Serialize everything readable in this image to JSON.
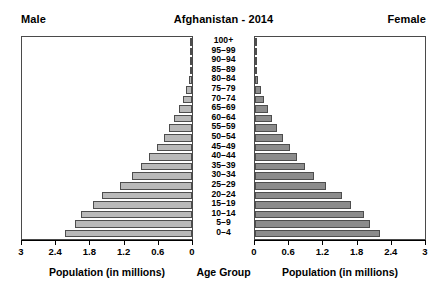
{
  "header": {
    "left_label": "Male",
    "title": "Afghanistan - 2014",
    "right_label": "Female"
  },
  "captions": {
    "male_axis": "Population (in millions)",
    "age_group": "Age Group",
    "female_axis": "Population (in millions)"
  },
  "colors": {
    "male_bar": "#b9b9b9",
    "female_bar": "#8c8c8c",
    "bar_outline": "#4d4d4d",
    "frame": "#4a4a4a",
    "text": "#000000"
  },
  "chart_data": {
    "type": "bar",
    "subtype": "population-pyramid",
    "title": "Afghanistan - 2014",
    "xlabel": "Population (in millions)",
    "ylabel": "Age Group",
    "grid": false,
    "legend_position": "top-outside",
    "xlim_left": [
      3,
      0
    ],
    "xlim_right": [
      0,
      3
    ],
    "xticks": [
      3,
      2.4,
      1.8,
      1.2,
      0.6,
      0
    ],
    "xticklabels_left": [
      "3",
      "2.4",
      "1.8",
      "1.2",
      "0.6",
      "0"
    ],
    "xticklabels_right": [
      "0",
      "0.6",
      "1.2",
      "1.8",
      "2.4",
      "3"
    ],
    "categories": [
      "100+",
      "95–99",
      "90–94",
      "85–89",
      "80–84",
      "75–79",
      "70–74",
      "65–69",
      "60–64",
      "55–59",
      "50–54",
      "45–49",
      "40–44",
      "35–39",
      "30–34",
      "25–29",
      "20–24",
      "15–19",
      "10–14",
      "5–9",
      "0–4"
    ],
    "series": [
      {
        "name": "Male",
        "side": "left",
        "color": "#b9b9b9",
        "values": [
          0.003,
          0.008,
          0.018,
          0.033,
          0.06,
          0.105,
          0.16,
          0.23,
          0.31,
          0.4,
          0.5,
          0.62,
          0.76,
          0.9,
          1.06,
          1.27,
          1.58,
          1.75,
          1.96,
          2.06,
          2.24
        ]
      },
      {
        "name": "Female",
        "side": "right",
        "color": "#8c8c8c",
        "values": [
          0.003,
          0.008,
          0.018,
          0.033,
          0.06,
          0.1,
          0.155,
          0.225,
          0.3,
          0.39,
          0.49,
          0.61,
          0.74,
          0.88,
          1.04,
          1.25,
          1.53,
          1.7,
          1.92,
          2.03,
          2.2
        ]
      }
    ]
  }
}
